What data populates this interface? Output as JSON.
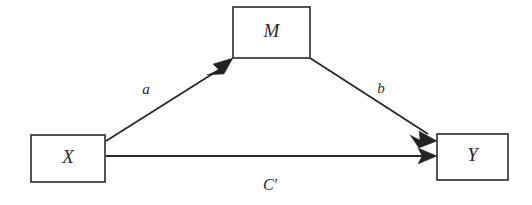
{
  "diagram": {
    "type": "mediation-model",
    "background_color": "#ffffff",
    "stroke_color": "#2a2a2a",
    "nodes": [
      {
        "id": "X",
        "label": "X",
        "role": "independent-variable",
        "x": 31,
        "y": 135,
        "width": 74,
        "height": 47
      },
      {
        "id": "M",
        "label": "M",
        "role": "mediator",
        "x": 233,
        "y": 7,
        "width": 77,
        "height": 51
      },
      {
        "id": "Y",
        "label": "Y",
        "role": "dependent-variable",
        "x": 437,
        "y": 134,
        "width": 71,
        "height": 46
      }
    ],
    "paths": [
      {
        "id": "a",
        "label": "a",
        "from": "X",
        "to": "M",
        "label_x": 146,
        "label_y": 91
      },
      {
        "id": "b",
        "label": "b",
        "from": "M",
        "to": "Y",
        "label_x": 381,
        "label_y": 90
      },
      {
        "id": "cprime",
        "label": "C′",
        "from": "X",
        "to": "Y",
        "label_x": 270,
        "label_y": 186
      }
    ]
  }
}
